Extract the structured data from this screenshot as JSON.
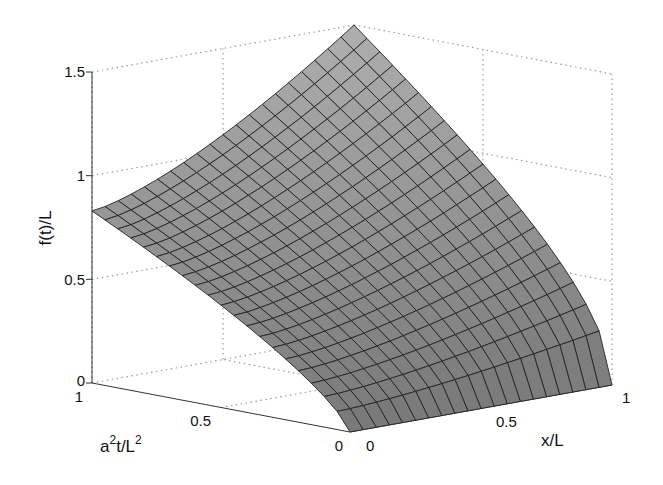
{
  "chart_data": {
    "type": "surface3d",
    "title": "",
    "xlabel": "x/L",
    "ylabel": "a^2t/L^2",
    "zlabel": "f(t)/L",
    "xlim": [
      0,
      1
    ],
    "ylim": [
      0,
      1
    ],
    "zlim": [
      0,
      1.5
    ],
    "x_ticks": [
      "0",
      "0.5",
      "1"
    ],
    "y_ticks": [
      "0",
      "0.5",
      "1"
    ],
    "z_ticks": [
      "0",
      "0.5",
      "1",
      "1.5"
    ],
    "grid": true,
    "grid_style": "dotted",
    "mesh_resolution": 20,
    "surface_color": "#a8a8a8",
    "mesh_line_color": "#222222",
    "corner_values": {
      "x0_t0": 0.0,
      "x1_t0": 0.0,
      "x0_t1": 0.83,
      "x1_t1": 1.5
    }
  },
  "axes": {
    "z_label": "f(t)/L",
    "y_label_base": "a",
    "y_label_sup1": "2",
    "y_label_mid": "t/L",
    "y_label_sup2": "2",
    "x_label": "x/L",
    "z_tick_0": "0",
    "z_tick_05": "0.5",
    "z_tick_1": "1",
    "z_tick_15": "1.5",
    "y_tick_1": "1",
    "y_tick_05": "0.5",
    "y_tick_0": "0",
    "x_tick_0": "0",
    "x_tick_05": "0.5",
    "x_tick_1": "1"
  }
}
